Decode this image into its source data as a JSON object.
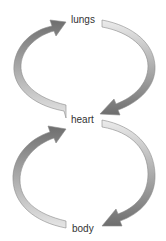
{
  "diagram": {
    "type": "circulation-cycle",
    "nodes": [
      {
        "id": "lungs",
        "label": "lungs"
      },
      {
        "id": "heart",
        "label": "heart"
      },
      {
        "id": "body",
        "label": "body"
      }
    ],
    "edges": [
      {
        "from": "heart",
        "to": "lungs",
        "side": "left"
      },
      {
        "from": "lungs",
        "to": "heart",
        "side": "right"
      },
      {
        "from": "body",
        "to": "heart",
        "side": "left"
      },
      {
        "from": "heart",
        "to": "body",
        "side": "right"
      }
    ],
    "colors": {
      "arrow_dark": "#6e6e6e",
      "arrow_light": "#e6e6e6",
      "outline": "#8a8a8a",
      "text": "#333333"
    }
  }
}
